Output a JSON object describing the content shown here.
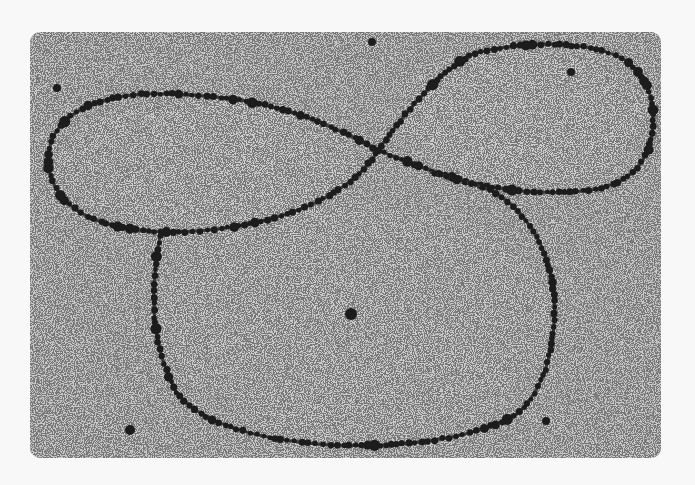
{
  "image": {
    "description": "Grayscale electron micrograph of a beaded circular chromatin/DNA molecule forming a figure-eight with an additional large lower loop",
    "background_color": "#f8f8f8",
    "field": {
      "x": 30,
      "y": 32,
      "width": 631,
      "height": 426,
      "corner_radius": 10,
      "color": "#c9c9c9"
    },
    "colors": {
      "bead": "#1e1e1e",
      "speckle": "#4a4a4a"
    },
    "strands": [
      {
        "name": "left-loop",
        "path": "M378,150 C340,130 300,110 240,100 C180,92 120,88 80,110 C45,130 40,165 60,195 C80,220 120,232 170,232 C230,232 290,218 330,195 C355,180 370,165 378,150"
      },
      {
        "name": "right-loop",
        "path": "M378,150 C400,120 430,80 470,55 C520,40 590,40 625,60 C655,80 658,120 648,150 C635,180 610,190 570,192 C520,195 470,185 430,170 C405,162 390,155 378,150"
      },
      {
        "name": "bottom-loop",
        "path": "M160,236 C150,290 150,340 175,390 C200,425 260,440 330,445 C400,448 470,440 515,415 C548,390 560,330 552,280 C545,240 520,205 490,190 C470,182 450,178 430,172"
      }
    ],
    "large_particles": [
      {
        "x": 57,
        "y": 88,
        "r": 4
      },
      {
        "x": 372,
        "y": 42,
        "r": 4
      },
      {
        "x": 571,
        "y": 72,
        "r": 4
      },
      {
        "x": 351,
        "y": 314,
        "r": 6
      },
      {
        "x": 130,
        "y": 430,
        "r": 5
      },
      {
        "x": 546,
        "y": 421,
        "r": 4
      }
    ]
  }
}
